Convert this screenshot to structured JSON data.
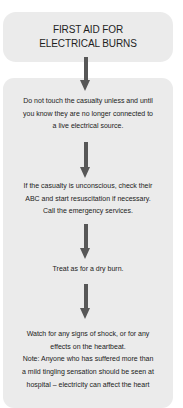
{
  "title": {
    "lines": [
      "FIRST AID FOR",
      "ELECTRICAL BURNS"
    ]
  },
  "steps": [
    {
      "lines": [
        "Do not touch the casualty unless and until",
        "you know they are no longer connected to",
        "a live electrical source."
      ]
    },
    {
      "lines": [
        "If the casualty is unconscious, check their",
        "ABC and start resuscitation if necessary.",
        "Call the emergency services."
      ]
    },
    {
      "lines": [
        "Treat as for a dry burn."
      ]
    },
    {
      "lines": [
        "Watch for any signs of shock, or for any",
        "effects on the heartbeat.",
        "Note: Anyone who has suffered more than",
        "a mild tingling sensation should be seen at",
        "hospital – electricity can affect the heart"
      ]
    }
  ],
  "arrows": [
    {
      "name": "arrow-down-icon"
    },
    {
      "name": "arrow-down-icon"
    },
    {
      "name": "arrow-down-icon"
    },
    {
      "name": "arrow-down-icon"
    }
  ],
  "colors": {
    "box_background": "#ebebeb",
    "arrow": "#575757",
    "text": "#222222"
  }
}
